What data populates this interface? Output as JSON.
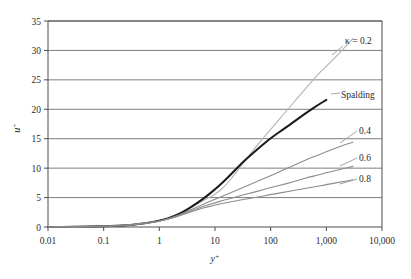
{
  "chart_data": {
    "type": "line",
    "title": "",
    "xlabel": "y+",
    "ylabel": "u+",
    "xscale": "log",
    "xlim": [
      0.01,
      10000
    ],
    "ylim": [
      0,
      35
    ],
    "grid": "horizontal",
    "legend_position": "inline-right",
    "xtick_labels": [
      "0.01",
      "0.1",
      "1",
      "10",
      "100",
      "1,000",
      "10,000"
    ],
    "xtick_values": [
      0.01,
      0.1,
      1,
      10,
      100,
      1000,
      10000
    ],
    "ytick_labels": [
      "0",
      "5",
      "10",
      "15",
      "20",
      "25",
      "30",
      "35"
    ],
    "ytick_values": [
      0,
      5,
      10,
      15,
      20,
      25,
      30,
      35
    ],
    "series": [
      {
        "name": "kappa-0.2",
        "label": "κ = 0.2",
        "color": "#b4b4b4",
        "width": 1.1,
        "x": [
          0.01,
          0.03,
          0.1,
          0.3,
          1,
          2,
          3,
          5,
          7,
          10,
          15,
          20,
          30,
          50,
          70,
          100,
          200,
          300,
          500,
          700,
          1000,
          1500,
          2000,
          3000
        ],
        "y": [
          0.01,
          0.03,
          0.1,
          0.3,
          0.99,
          1.93,
          2.77,
          4.0,
          4.75,
          5.5,
          6.9,
          8.3,
          10.5,
          13.2,
          14.9,
          16.6,
          19.9,
          21.9,
          24.3,
          25.9,
          27.3,
          29.0,
          30.2,
          32.0
        ]
      },
      {
        "name": "spalding",
        "label": "Spalding",
        "color": "#1a1a1a",
        "width": 2.0,
        "x": [
          0.01,
          0.03,
          0.1,
          0.3,
          1,
          2,
          3,
          5,
          7,
          10,
          15,
          20,
          30,
          50,
          70,
          100,
          200,
          300,
          500,
          700,
          1000
        ],
        "y": [
          0.01,
          0.03,
          0.1,
          0.3,
          0.99,
          1.95,
          2.83,
          4.2,
          5.2,
          6.4,
          7.9,
          9.1,
          10.8,
          12.7,
          13.9,
          15.1,
          17.1,
          18.3,
          19.8,
          20.7,
          21.6
        ]
      },
      {
        "name": "kappa-0.4",
        "label": "0.4",
        "color": "#8c8c8c",
        "width": 1.1,
        "x": [
          0.01,
          0.03,
          0.1,
          0.3,
          1,
          2,
          3,
          5,
          7,
          10,
          15,
          20,
          30,
          50,
          70,
          100,
          200,
          300,
          500,
          700,
          1000,
          2000,
          3000
        ],
        "y": [
          0.01,
          0.03,
          0.1,
          0.3,
          0.97,
          1.83,
          2.55,
          3.5,
          4.1,
          4.7,
          5.4,
          5.9,
          6.6,
          7.5,
          8.1,
          8.7,
          10.0,
          10.7,
          11.7,
          12.2,
          12.8,
          13.9,
          14.4
        ]
      },
      {
        "name": "kappa-0.6",
        "label": "0.6",
        "color": "#8c8c8c",
        "width": 1.1,
        "x": [
          0.01,
          0.03,
          0.1,
          0.3,
          1,
          2,
          3,
          5,
          7,
          10,
          15,
          20,
          30,
          50,
          70,
          100,
          200,
          300,
          500,
          700,
          1000,
          2000,
          3000
        ],
        "y": [
          0.01,
          0.03,
          0.1,
          0.3,
          0.95,
          1.76,
          2.4,
          3.2,
          3.7,
          4.1,
          4.6,
          4.9,
          5.4,
          5.9,
          6.3,
          6.7,
          7.4,
          7.9,
          8.5,
          8.8,
          9.2,
          9.9,
          10.3
        ]
      },
      {
        "name": "kappa-0.8",
        "label": "0.8",
        "color": "#8c8c8c",
        "width": 1.1,
        "x": [
          0.01,
          0.03,
          0.1,
          0.3,
          1,
          2,
          3,
          5,
          7,
          10,
          15,
          20,
          30,
          50,
          70,
          100,
          200,
          300,
          500,
          700,
          1000,
          2000,
          3000
        ],
        "y": [
          0.01,
          0.03,
          0.1,
          0.3,
          0.94,
          1.71,
          2.3,
          3.0,
          3.4,
          3.7,
          4.1,
          4.3,
          4.6,
          5.0,
          5.2,
          5.5,
          6.0,
          6.3,
          6.7,
          6.9,
          7.2,
          7.7,
          8.0
        ]
      }
    ],
    "annotations": [
      {
        "name": "label-kappa-0.2",
        "text": "κ = 0.2",
        "x_px": 345,
        "y_px": 44
      },
      {
        "name": "label-spalding",
        "text": "Spalding",
        "x_px": 341,
        "y_px": 98
      },
      {
        "name": "label-0.4",
        "text": "0.4",
        "x_px": 359,
        "y_px": 134
      },
      {
        "name": "label-0.6",
        "text": "0.6",
        "x_px": 359,
        "y_px": 161
      },
      {
        "name": "label-0.8",
        "text": "0.8",
        "x_px": 359,
        "y_px": 182
      }
    ],
    "colors": {
      "axis": "#4d4d4d",
      "gridline": "#707070",
      "text": "#2b2b2b",
      "background": "#ffffff"
    }
  },
  "axis": {
    "y_title_base": "u",
    "y_title_sup": "+",
    "x_title_base": "y",
    "x_title_sup": "+"
  }
}
